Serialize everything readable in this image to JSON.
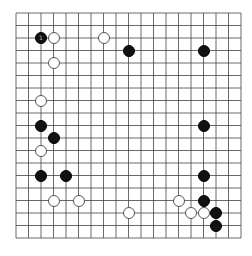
{
  "board": {
    "size": 19,
    "origin_x": 16,
    "origin_y": 13,
    "spacing": 12.5,
    "line_color": "#444444",
    "background": "#ffffff"
  },
  "stones": [
    {
      "color": "black",
      "col": 2,
      "row": 2,
      "label": "1"
    },
    {
      "color": "white",
      "col": 3,
      "row": 2
    },
    {
      "color": "white",
      "col": 7,
      "row": 2
    },
    {
      "color": "black",
      "col": 9,
      "row": 3
    },
    {
      "color": "black",
      "col": 15,
      "row": 3
    },
    {
      "color": "white",
      "col": 3,
      "row": 4
    },
    {
      "color": "white",
      "col": 2,
      "row": 7
    },
    {
      "color": "black",
      "col": 2,
      "row": 9
    },
    {
      "color": "black",
      "col": 15,
      "row": 9
    },
    {
      "color": "black",
      "col": 3,
      "row": 10
    },
    {
      "color": "white",
      "col": 2,
      "row": 11
    },
    {
      "color": "black",
      "col": 2,
      "row": 13
    },
    {
      "color": "black",
      "col": 4,
      "row": 13
    },
    {
      "color": "black",
      "col": 15,
      "row": 13
    },
    {
      "color": "white",
      "col": 3,
      "row": 15
    },
    {
      "color": "white",
      "col": 5,
      "row": 15
    },
    {
      "color": "white",
      "col": 13,
      "row": 15
    },
    {
      "color": "black",
      "col": 15,
      "row": 15
    },
    {
      "color": "white",
      "col": 9,
      "row": 16
    },
    {
      "color": "white",
      "col": 14,
      "row": 16
    },
    {
      "color": "white",
      "col": 15,
      "row": 16
    },
    {
      "color": "black",
      "col": 16,
      "row": 16
    },
    {
      "color": "black",
      "col": 16,
      "row": 17
    }
  ]
}
